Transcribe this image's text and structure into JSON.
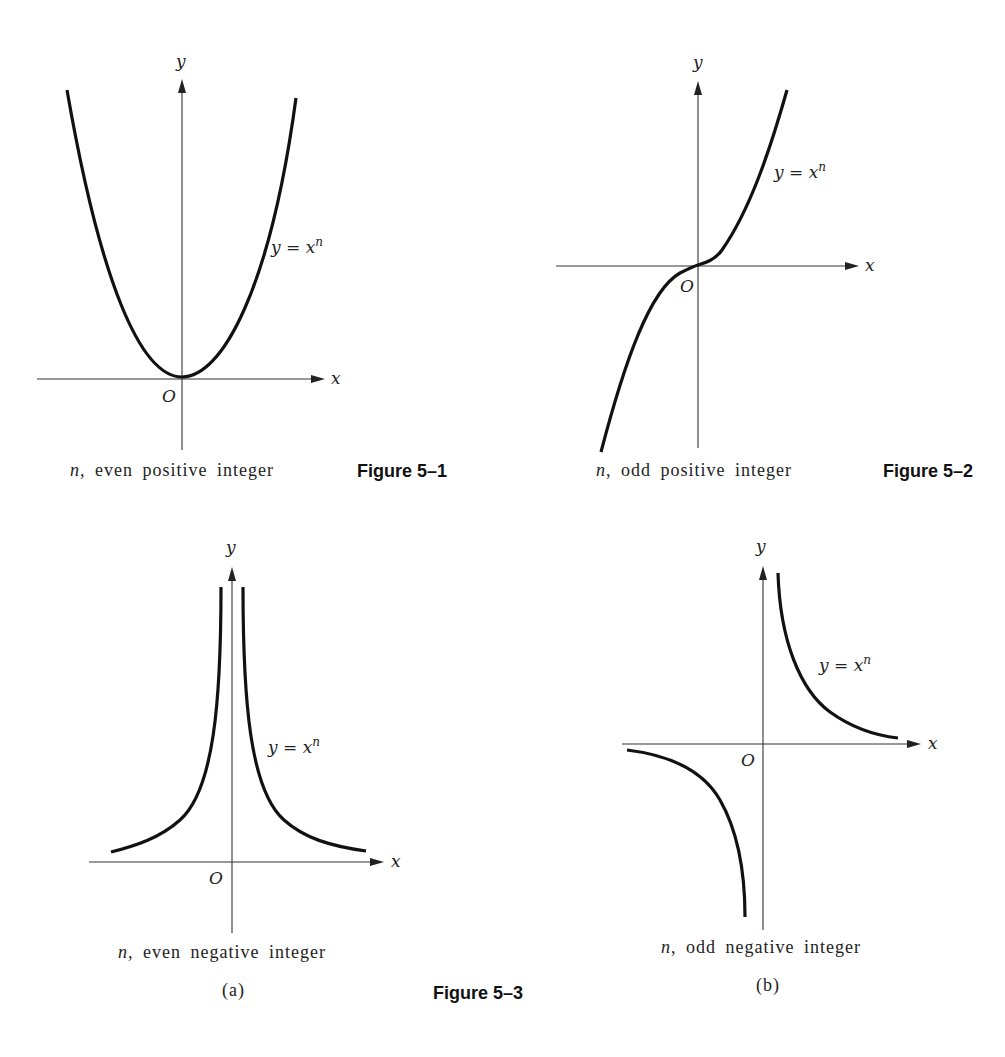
{
  "figures": {
    "fig1": {
      "label": "Figure 5–1",
      "caption_var": "n",
      "caption_text": ", even positive integer",
      "curve_label": "y = x",
      "curve_exp": "n",
      "axis_x": "x",
      "axis_y": "y",
      "origin": "O"
    },
    "fig2": {
      "label": "Figure 5–2",
      "caption_var": "n",
      "caption_text": ", odd positive integer",
      "curve_label": "y = x",
      "curve_exp": "n",
      "axis_x": "x",
      "axis_y": "y",
      "origin": "O"
    },
    "fig3": {
      "label": "Figure 5–3",
      "a": {
        "caption_var": "n",
        "caption_text": ", even negative integer",
        "sublabel": "(a)",
        "curve_label": "y = x",
        "curve_exp": "n",
        "axis_x": "x",
        "axis_y": "y",
        "origin": "O"
      },
      "b": {
        "caption_var": "n",
        "caption_text": ", odd negative integer",
        "sublabel": "(b)",
        "curve_label": "y = x",
        "curve_exp": "n",
        "axis_x": "x",
        "axis_y": "y",
        "origin": "O"
      }
    }
  },
  "colors": {
    "background": "#ffffff",
    "ink": "#111111"
  }
}
